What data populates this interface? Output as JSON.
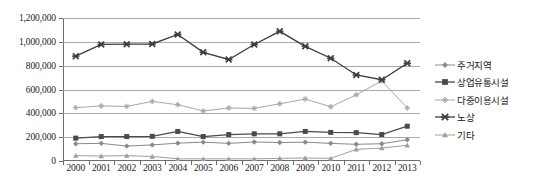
{
  "chart_data": {
    "type": "line",
    "title": "",
    "xlabel": "",
    "ylabel": "",
    "x": [
      "2000",
      "2001",
      "2002",
      "2003",
      "2004",
      "2005",
      "2006",
      "2007",
      "2008",
      "2009",
      "2010",
      "2011",
      "2012",
      "2013"
    ],
    "categories": [
      "2000",
      "2001",
      "2002",
      "2003",
      "2004",
      "2005",
      "2006",
      "2007",
      "2008",
      "2009",
      "2010",
      "2011",
      "2012",
      "2013"
    ],
    "ylim": [
      0,
      1200000
    ],
    "ytick_labels": [
      "0",
      "200,000",
      "400,000",
      "600,000",
      "800,000",
      "1,000,000",
      "1,200,000"
    ],
    "ytick_values": [
      0,
      200000,
      400000,
      600000,
      800000,
      1000000,
      1200000
    ],
    "grid": true,
    "legend_position": "right",
    "series": [
      {
        "name": "주거지역",
        "marker": "diamond",
        "color": "#8a8a8a",
        "values": [
          145000,
          148000,
          125000,
          135000,
          150000,
          158000,
          148000,
          160000,
          155000,
          158000,
          148000,
          140000,
          145000,
          178000
        ]
      },
      {
        "name": "상업유통시설",
        "marker": "square",
        "color": "#4a4a4a",
        "values": [
          192000,
          205000,
          205000,
          207000,
          248000,
          205000,
          222000,
          228000,
          228000,
          248000,
          240000,
          238000,
          222000,
          292000
        ]
      },
      {
        "name": "다중이용시설",
        "marker": "plus",
        "color": "#a8a8a8",
        "values": [
          448000,
          462000,
          458000,
          500000,
          472000,
          420000,
          445000,
          442000,
          480000,
          520000,
          455000,
          555000,
          672000,
          445000
        ]
      },
      {
        "name": "노상",
        "marker": "cross",
        "color": "#3d3d3d",
        "values": [
          880000,
          978000,
          980000,
          982000,
          1062000,
          912000,
          852000,
          978000,
          1088000,
          962000,
          862000,
          722000,
          682000,
          820000
        ]
      },
      {
        "name": "기타",
        "marker": "triangle",
        "color": "#9e9e9e",
        "values": [
          45000,
          42000,
          45000,
          38000,
          18000,
          18000,
          18000,
          18000,
          22000,
          25000,
          22000,
          98000,
          108000,
          132000
        ]
      }
    ]
  }
}
